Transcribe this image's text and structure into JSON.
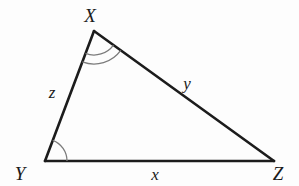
{
  "figure": {
    "type": "geometry-diagram",
    "shape": "triangle",
    "background_color": "#fdfdfd",
    "line_color": "#1c1c1c",
    "arc_color": "#7b7b7b",
    "vertices": [
      {
        "name": "X",
        "label": "X",
        "x": 94,
        "y": 31,
        "label_x": 90,
        "label_y": 22,
        "angle_marks": 2
      },
      {
        "name": "Y",
        "label": "Y",
        "x": 45,
        "y": 161,
        "label_x": 20,
        "label_y": 180,
        "angle_marks": 1
      },
      {
        "name": "Z",
        "label": "Z",
        "x": 274,
        "y": 161,
        "label_x": 278,
        "label_y": 180,
        "angle_marks": 0
      }
    ],
    "sides": [
      {
        "name": "side-xy",
        "label": "z",
        "from": "X",
        "to": "Y",
        "label_x": 52,
        "label_y": 98
      },
      {
        "name": "side-xz",
        "label": "y",
        "from": "X",
        "to": "Z",
        "label_x": 187,
        "label_y": 89
      },
      {
        "name": "side-yz",
        "label": "x",
        "from": "Y",
        "to": "Z",
        "label_x": 155,
        "label_y": 180
      }
    ]
  }
}
